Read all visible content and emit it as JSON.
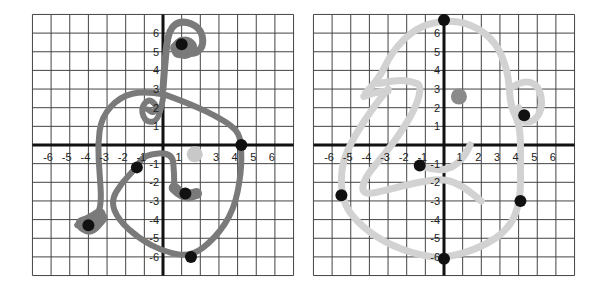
{
  "figure": {
    "panels": [
      {
        "id": "left",
        "grid": {
          "xmin": -7,
          "xmax": 7,
          "ymin": -7,
          "ymax": 7,
          "x_ticks": [
            -6,
            -5,
            -4,
            -3,
            -2,
            -1,
            1,
            2,
            3,
            4,
            5,
            6
          ],
          "y_ticks": [
            6,
            5,
            4,
            3,
            2,
            1,
            -1,
            -2,
            -3,
            -4,
            -5,
            -6
          ]
        },
        "curve_color": "#7a7a7a",
        "highlight_color": "#c8c8c8",
        "black_points": [
          {
            "x": 1.0,
            "y": 5.4
          },
          {
            "x": 4.2,
            "y": 0.0
          },
          {
            "x": -1.4,
            "y": -1.2
          },
          {
            "x": 1.2,
            "y": -2.6
          },
          {
            "x": -4.0,
            "y": -4.3
          },
          {
            "x": 1.5,
            "y": -6.0
          }
        ],
        "gray_points": [
          {
            "x": 1.7,
            "y": -0.5
          }
        ]
      },
      {
        "id": "right",
        "grid": {
          "xmin": -7,
          "xmax": 7,
          "ymin": -7,
          "ymax": 7,
          "x_ticks": [
            -6,
            -5,
            -4,
            -3,
            -2,
            -1,
            1,
            2,
            3,
            4,
            5,
            6
          ],
          "y_ticks": [
            6,
            5,
            4,
            3,
            2,
            1,
            -1,
            -2,
            -3,
            -4,
            -5,
            -6
          ]
        },
        "curve_color": "#d2d2d2",
        "highlight_color": "#8a8a8a",
        "black_points": [
          {
            "x": 0.0,
            "y": 6.7
          },
          {
            "x": 4.3,
            "y": 1.6
          },
          {
            "x": -1.3,
            "y": -1.1
          },
          {
            "x": -5.5,
            "y": -2.7
          },
          {
            "x": 4.1,
            "y": -3.0
          },
          {
            "x": 0.0,
            "y": -6.1
          }
        ],
        "gray_points": [
          {
            "x": 0.8,
            "y": 2.6
          }
        ]
      }
    ]
  },
  "colors": {
    "grid_line": "#444444",
    "axis_line": "#111111",
    "point_black": "#111111"
  }
}
